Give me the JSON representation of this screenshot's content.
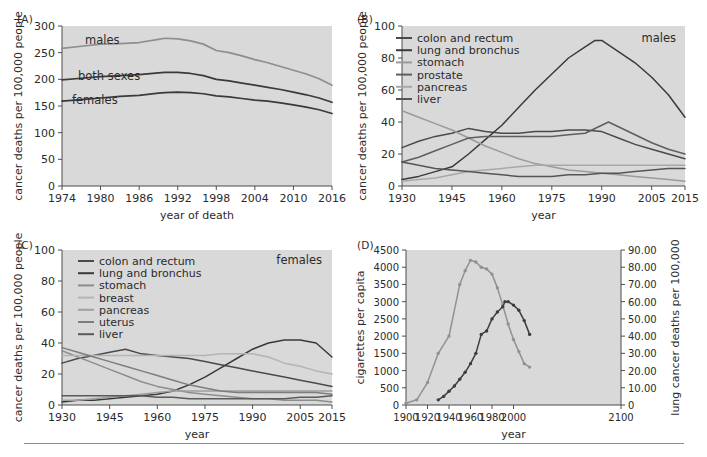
{
  "figure": {
    "background": "#ffffff",
    "plot_background": "#d9d9d9",
    "axis_color": "#4d4d4d",
    "text_color": "#2b2b2b"
  },
  "panels": {
    "a": {
      "label": "(A)",
      "ylabel": "cancer deaths per 100,000 people",
      "xlabel": "year of death",
      "inline_labels": [
        "males",
        "both sexes",
        "females"
      ]
    },
    "b": {
      "label": "(B)",
      "ylabel": "cancer deaths per 100,000 people",
      "xlabel": "year",
      "corner_label": "males",
      "legend": [
        "colon and rectum",
        "lung and bronchus",
        "stomach",
        "prostate",
        "pancreas",
        "liver"
      ]
    },
    "c": {
      "label": "(C)",
      "ylabel": "cancer deaths per 100,000 people",
      "xlabel": "year",
      "corner_label": "females",
      "legend": [
        "colon and rectum",
        "lung and bronchus",
        "stomach",
        "breast",
        "pancreas",
        "uterus",
        "liver"
      ]
    },
    "d": {
      "label": "(D)",
      "ylabel_left": "cigarettes per capita",
      "ylabel_right": "lung cancer deaths per 100,000",
      "xlabel": "year"
    }
  },
  "chart_data": [
    {
      "id": "panel_a",
      "type": "line",
      "title": "(A)",
      "xlabel": "year of death",
      "ylabel": "cancer deaths per 100,000 people",
      "xlim": [
        1974,
        2016
      ],
      "ylim": [
        0,
        300
      ],
      "xticks": [
        1974,
        1980,
        1986,
        1992,
        1998,
        2004,
        2010,
        2016
      ],
      "yticks": [
        0,
        50,
        100,
        150,
        200,
        250,
        300
      ],
      "grid": false,
      "legend": "inline-annotations",
      "series": [
        {
          "name": "males",
          "color": "#8e8e8e",
          "x": [
            1974,
            1977,
            1980,
            1983,
            1986,
            1989,
            1990,
            1992,
            1994,
            1996,
            1998,
            2000,
            2002,
            2004,
            2006,
            2008,
            2010,
            2012,
            2014,
            2016
          ],
          "values": [
            258,
            262,
            266,
            267,
            269,
            275,
            277,
            276,
            272,
            266,
            254,
            250,
            244,
            237,
            231,
            224,
            217,
            210,
            201,
            189
          ]
        },
        {
          "name": "both sexes",
          "color": "#3a3a3a",
          "x": [
            1974,
            1977,
            1980,
            1983,
            1986,
            1989,
            1990,
            1992,
            1994,
            1996,
            1998,
            2000,
            2002,
            2004,
            2006,
            2008,
            2010,
            2012,
            2014,
            2016
          ],
          "values": [
            199,
            202,
            205,
            207,
            209,
            212,
            213,
            213,
            211,
            207,
            200,
            197,
            193,
            189,
            185,
            181,
            176,
            171,
            165,
            157
          ]
        },
        {
          "name": "females",
          "color": "#3a3a3a",
          "x": [
            1974,
            1977,
            1980,
            1983,
            1986,
            1989,
            1990,
            1992,
            1994,
            1996,
            1998,
            2000,
            2002,
            2004,
            2006,
            2008,
            2010,
            2012,
            2014,
            2016
          ],
          "values": [
            159,
            162,
            165,
            168,
            170,
            174,
            175,
            176,
            175,
            173,
            169,
            167,
            164,
            161,
            159,
            156,
            152,
            148,
            143,
            136
          ]
        }
      ]
    },
    {
      "id": "panel_b",
      "type": "line",
      "title": "(B)",
      "subtitle": "males",
      "xlabel": "year",
      "ylabel": "cancer deaths per 100,000 people",
      "xlim": [
        1930,
        2015
      ],
      "ylim": [
        0,
        100
      ],
      "xticks": [
        1930,
        1945,
        1960,
        1975,
        1990,
        2005,
        2015
      ],
      "yticks": [
        0,
        20,
        40,
        60,
        80,
        100
      ],
      "grid": false,
      "legend_position": "upper-left",
      "series": [
        {
          "name": "colon and rectum",
          "color": "#4a4a4a",
          "x": [
            1930,
            1935,
            1940,
            1945,
            1950,
            1955,
            1960,
            1965,
            1970,
            1975,
            1980,
            1985,
            1990,
            1995,
            2000,
            2005,
            2010,
            2015
          ],
          "values": [
            24,
            28,
            31,
            33,
            36,
            34,
            33,
            33,
            34,
            34,
            35,
            35,
            34,
            30,
            26,
            23,
            20,
            17
          ]
        },
        {
          "name": "lung and bronchus",
          "color": "#3a3a3a",
          "x": [
            1930,
            1935,
            1940,
            1945,
            1950,
            1955,
            1960,
            1965,
            1970,
            1975,
            1980,
            1985,
            1988,
            1990,
            1995,
            2000,
            2005,
            2010,
            2015
          ],
          "values": [
            4,
            6,
            9,
            12,
            20,
            29,
            38,
            49,
            60,
            70,
            80,
            87,
            91,
            91,
            84,
            77,
            68,
            57,
            43
          ]
        },
        {
          "name": "stomach",
          "color": "#9a9a9a",
          "x": [
            1930,
            1935,
            1940,
            1945,
            1950,
            1955,
            1960,
            1965,
            1970,
            1975,
            1980,
            1985,
            1990,
            1995,
            2000,
            2005,
            2010,
            2015
          ],
          "values": [
            47,
            43,
            39,
            35,
            30,
            25,
            21,
            17,
            14,
            12,
            10,
            9,
            8,
            7,
            6,
            5,
            4,
            3
          ]
        },
        {
          "name": "prostate",
          "color": "#5e5e5e",
          "x": [
            1930,
            1935,
            1940,
            1945,
            1950,
            1955,
            1960,
            1965,
            1970,
            1975,
            1980,
            1985,
            1990,
            1992,
            1995,
            2000,
            2005,
            2010,
            2015
          ],
          "values": [
            15,
            18,
            22,
            26,
            30,
            31,
            31,
            31,
            31,
            31,
            32,
            33,
            38,
            40,
            37,
            32,
            27,
            23,
            20
          ]
        },
        {
          "name": "pancreas",
          "color": "#a8a8a8",
          "x": [
            1930,
            1935,
            1940,
            1945,
            1950,
            1955,
            1960,
            1965,
            1970,
            1975,
            1980,
            1985,
            1990,
            1995,
            2000,
            2005,
            2010,
            2015
          ],
          "values": [
            3,
            4,
            5,
            7,
            9,
            10,
            11,
            12,
            13,
            13,
            13,
            13,
            13,
            13,
            13,
            13,
            13,
            13
          ]
        },
        {
          "name": "liver",
          "color": "#555555",
          "x": [
            1930,
            1935,
            1940,
            1945,
            1950,
            1955,
            1960,
            1965,
            1970,
            1975,
            1980,
            1985,
            1990,
            1995,
            2000,
            2005,
            2010,
            2015
          ],
          "values": [
            15,
            13,
            11,
            10,
            9,
            8,
            7,
            6,
            6,
            6,
            7,
            7,
            8,
            8,
            9,
            10,
            11,
            11
          ]
        }
      ]
    },
    {
      "id": "panel_c",
      "type": "line",
      "title": "(C)",
      "subtitle": "females",
      "xlabel": "year",
      "ylabel": "cancer deaths per 100,000 people",
      "xlim": [
        1930,
        2015
      ],
      "ylim": [
        0,
        100
      ],
      "xticks": [
        1930,
        1945,
        1960,
        1975,
        1990,
        2005,
        2015
      ],
      "yticks": [
        0,
        20,
        40,
        60,
        80,
        100
      ],
      "grid": false,
      "legend_position": "upper-left",
      "series": [
        {
          "name": "colon and rectum",
          "color": "#4a4a4a",
          "x": [
            1930,
            1935,
            1940,
            1945,
            1950,
            1955,
            1960,
            1965,
            1970,
            1975,
            1980,
            1985,
            1990,
            1995,
            2000,
            2005,
            2010,
            2015
          ],
          "values": [
            27,
            30,
            32,
            34,
            36,
            33,
            32,
            31,
            30,
            28,
            26,
            24,
            22,
            20,
            18,
            16,
            14,
            12
          ]
        },
        {
          "name": "lung and bronchus",
          "color": "#3a3a3a",
          "x": [
            1930,
            1935,
            1940,
            1945,
            1950,
            1955,
            1960,
            1965,
            1970,
            1975,
            1980,
            1985,
            1990,
            1995,
            2000,
            2003,
            2005,
            2010,
            2015
          ],
          "values": [
            2,
            3,
            3,
            4,
            5,
            6,
            7,
            9,
            13,
            18,
            24,
            30,
            36,
            40,
            42,
            42,
            42,
            40,
            31
          ]
        },
        {
          "name": "stomach",
          "color": "#8d8d8d",
          "x": [
            1930,
            1935,
            1940,
            1945,
            1950,
            1955,
            1960,
            1965,
            1970,
            1975,
            1980,
            1985,
            1990,
            1995,
            2000,
            2005,
            2010,
            2015
          ],
          "values": [
            35,
            31,
            27,
            23,
            19,
            15,
            12,
            10,
            8,
            7,
            6,
            5,
            4,
            4,
            3,
            3,
            3,
            2
          ]
        },
        {
          "name": "breast",
          "color": "#b4b4b4",
          "x": [
            1930,
            1935,
            1940,
            1945,
            1950,
            1955,
            1960,
            1965,
            1970,
            1975,
            1980,
            1985,
            1990,
            1995,
            2000,
            2005,
            2010,
            2015
          ],
          "values": [
            32,
            32,
            32,
            32,
            32,
            32,
            32,
            32,
            32,
            32,
            33,
            33,
            33,
            31,
            27,
            25,
            22,
            20
          ]
        },
        {
          "name": "pancreas",
          "color": "#9f9f9f",
          "x": [
            1930,
            1935,
            1940,
            1945,
            1950,
            1955,
            1960,
            1965,
            1970,
            1975,
            1980,
            1985,
            1990,
            1995,
            2000,
            2005,
            2010,
            2015
          ],
          "values": [
            3,
            3,
            4,
            5,
            6,
            7,
            8,
            9,
            9,
            9,
            9,
            9,
            9,
            9,
            9,
            9,
            9,
            9
          ]
        },
        {
          "name": "uterus",
          "color": "#7d7d7d",
          "x": [
            1930,
            1935,
            1940,
            1945,
            1950,
            1955,
            1960,
            1965,
            1970,
            1975,
            1980,
            1985,
            1990,
            1995,
            2000,
            2005,
            2010,
            2015
          ],
          "values": [
            37,
            34,
            31,
            28,
            25,
            22,
            19,
            16,
            13,
            11,
            9,
            8,
            8,
            8,
            8,
            8,
            8,
            7
          ]
        },
        {
          "name": "liver",
          "color": "#5a5a5a",
          "x": [
            1930,
            1935,
            1940,
            1945,
            1950,
            1955,
            1960,
            1965,
            1970,
            1975,
            1980,
            1985,
            1990,
            1995,
            2000,
            2005,
            2010,
            2015
          ],
          "values": [
            6,
            6,
            6,
            6,
            6,
            6,
            5,
            5,
            4,
            4,
            4,
            4,
            4,
            4,
            4,
            5,
            5,
            6
          ]
        }
      ]
    },
    {
      "id": "panel_d",
      "type": "line",
      "title": "(D)",
      "xlabel": "year",
      "ylabel": "cigarettes per capita",
      "ylabel_right": "lung cancer deaths per 100,000",
      "xlim": [
        1900,
        2100
      ],
      "ylim": [
        0,
        4500
      ],
      "ylim_right": [
        0,
        90
      ],
      "xticks": [
        1900,
        1920,
        1940,
        1960,
        1980,
        2000,
        2100
      ],
      "yticks": [
        0,
        500,
        1000,
        1500,
        2000,
        2500,
        3000,
        3500,
        4000,
        4500
      ],
      "yticks_right": [
        "0",
        "10.00",
        "20.00",
        "30.00",
        "40.00",
        "50.00",
        "60.00",
        "70.00",
        "80.00",
        "90.00"
      ],
      "grid": false,
      "markers": true,
      "series": [
        {
          "name": "cigarettes per capita",
          "axis": "left",
          "color": "#919191",
          "x": [
            1900,
            1910,
            1920,
            1930,
            1940,
            1950,
            1955,
            1960,
            1965,
            1970,
            1975,
            1980,
            1985,
            1990,
            1995,
            2000,
            2005,
            2010,
            2015
          ],
          "values": [
            50,
            150,
            650,
            1500,
            2000,
            3500,
            3900,
            4200,
            4150,
            4000,
            3950,
            3800,
            3400,
            2900,
            2350,
            1900,
            1550,
            1200,
            1100
          ]
        },
        {
          "name": "lung cancer deaths per 100,000",
          "axis": "right",
          "color": "#3d3d3d",
          "x": [
            1930,
            1935,
            1940,
            1945,
            1950,
            1955,
            1960,
            1965,
            1970,
            1975,
            1980,
            1985,
            1990,
            1992,
            1995,
            2000,
            2005,
            2010,
            2015
          ],
          "values": [
            3,
            5,
            8,
            11,
            15,
            19,
            24,
            30,
            41,
            43,
            50,
            54,
            57,
            60,
            60,
            58,
            55,
            49,
            41
          ]
        }
      ]
    }
  ]
}
